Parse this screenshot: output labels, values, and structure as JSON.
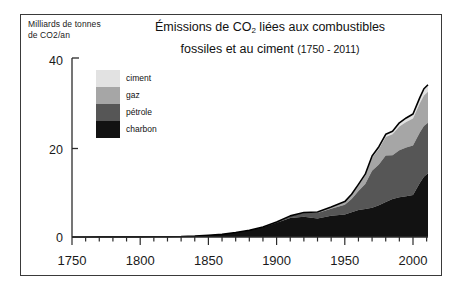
{
  "frame": {
    "border_color": "#3a3a3a"
  },
  "axis_label": {
    "line1": "Milliards de tonnes",
    "line2": "de CO2/an"
  },
  "title": {
    "line1_pre": "Émissions de CO",
    "line1_sub": "2",
    "line1_post": " liées aux combustibles",
    "line2": "fossiles et au ciment",
    "line2_range": "(1750 - 2011)"
  },
  "legend": {
    "items": [
      {
        "label": "ciment",
        "color": "#e2e2e2"
      },
      {
        "label": "gaz",
        "color": "#a6a6a6"
      },
      {
        "label": "pétrole",
        "color": "#565656"
      },
      {
        "label": "charbon",
        "color": "#121212"
      }
    ]
  },
  "chart_data": {
    "type": "area",
    "stacked": true,
    "title": "Émissions de CO2 liées aux combustibles fossiles et au ciment (1750 - 2011)",
    "xlabel": "",
    "ylabel": "Milliards de tonnes de CO2/an",
    "xlim": [
      1750,
      2011
    ],
    "ylim": [
      0,
      40
    ],
    "yticks": [
      0,
      20,
      40
    ],
    "ytick_labels": [
      "0",
      "20",
      "40"
    ],
    "xticks": [
      1750,
      1800,
      1850,
      1900,
      1950,
      2000
    ],
    "xtick_labels": [
      "1750",
      "1800",
      "1850",
      "1900",
      "1950",
      "2000"
    ],
    "minor_tick_step": 10,
    "grid": false,
    "legend_position": "upper-left-inside",
    "x": [
      1750,
      1760,
      1770,
      1780,
      1790,
      1800,
      1810,
      1820,
      1830,
      1840,
      1850,
      1860,
      1870,
      1880,
      1890,
      1900,
      1910,
      1920,
      1930,
      1940,
      1950,
      1955,
      1960,
      1965,
      1970,
      1975,
      1980,
      1985,
      1990,
      1995,
      2000,
      2005,
      2008,
      2011
    ],
    "series": [
      {
        "name": "charbon",
        "color": "#121212",
        "values": [
          0.01,
          0.01,
          0.02,
          0.02,
          0.03,
          0.03,
          0.05,
          0.07,
          0.1,
          0.2,
          0.4,
          0.6,
          1.0,
          1.5,
          2.2,
          3.2,
          4.3,
          4.6,
          4.2,
          4.8,
          5.1,
          5.6,
          6.1,
          6.3,
          6.6,
          7.2,
          7.9,
          8.6,
          9.0,
          9.2,
          9.5,
          12.2,
          13.6,
          14.4
        ]
      },
      {
        "name": "pétrole",
        "color": "#565656",
        "values": [
          0,
          0,
          0,
          0,
          0,
          0,
          0,
          0,
          0,
          0,
          0,
          0,
          0.01,
          0.03,
          0.06,
          0.15,
          0.4,
          0.8,
          1.2,
          1.6,
          2.2,
          3.0,
          4.3,
          5.7,
          8.4,
          9.2,
          10.5,
          9.9,
          10.6,
          11.0,
          11.2,
          11.4,
          11.5,
          11.4
        ]
      },
      {
        "name": "gaz",
        "color": "#a6a6a6",
        "values": [
          0,
          0,
          0,
          0,
          0,
          0,
          0,
          0,
          0,
          0,
          0,
          0,
          0,
          0,
          0.01,
          0.02,
          0.05,
          0.1,
          0.2,
          0.3,
          0.6,
          0.9,
          1.3,
          1.9,
          2.9,
          3.5,
          4.2,
          4.7,
          5.4,
          5.8,
          6.1,
          6.6,
          6.9,
          7.0
        ]
      },
      {
        "name": "ciment",
        "color": "#e2e2e2",
        "values": [
          0,
          0,
          0,
          0,
          0,
          0,
          0,
          0,
          0,
          0,
          0,
          0,
          0,
          0,
          0,
          0.01,
          0.02,
          0.03,
          0.05,
          0.06,
          0.1,
          0.15,
          0.2,
          0.3,
          0.4,
          0.5,
          0.6,
          0.7,
          0.8,
          0.9,
          1.0,
          1.3,
          1.5,
          1.6
        ]
      }
    ],
    "total_peak": 34.4
  }
}
